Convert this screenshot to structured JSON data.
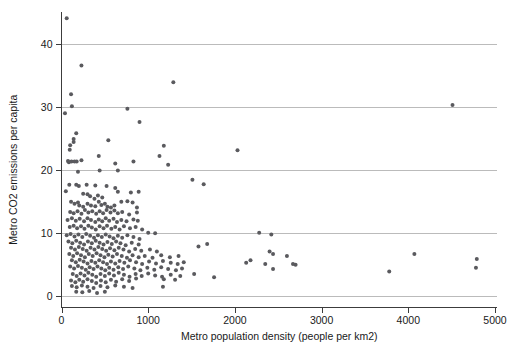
{
  "chart_data": {
    "type": "scatter",
    "title": "",
    "xlabel": "Metro population density (people per km2)",
    "ylabel": "Metro CO2 emissions per capita",
    "xlim": [
      -90,
      5050
    ],
    "ylim": [
      -1.2,
      45.5
    ],
    "xticks": [
      0,
      1000,
      2000,
      3000,
      4000,
      5000
    ],
    "yticks": [
      0,
      10,
      20,
      30,
      40
    ],
    "xticklabels": [
      "0",
      "1000",
      "2000",
      "3000",
      "4000",
      "5000"
    ],
    "yticklabels": [
      "0",
      "10",
      "20",
      "30",
      "40"
    ],
    "grid": "horizontal",
    "grid_color": "#bbbbbb",
    "marker_color": "#5a5a5e",
    "marker_size": 2.0,
    "legend": "none",
    "series": [
      {
        "name": "Metro areas",
        "points": [
          [
            60,
            44.1
          ],
          [
            230,
            36.6
          ],
          [
            1290,
            33.9
          ],
          [
            110,
            32.0
          ],
          [
            120,
            30.1
          ],
          [
            4510,
            30.3
          ],
          [
            40,
            29.0
          ],
          [
            760,
            29.7
          ],
          [
            900,
            27.6
          ],
          [
            2030,
            23.1
          ],
          [
            170,
            25.8
          ],
          [
            140,
            24.9
          ],
          [
            140,
            24.4
          ],
          [
            540,
            24.7
          ],
          [
            1180,
            23.8
          ],
          [
            100,
            23.9
          ],
          [
            95,
            23.2
          ],
          [
            1130,
            22.2
          ],
          [
            430,
            22.2
          ],
          [
            75,
            21.4
          ],
          [
            85,
            21.2
          ],
          [
            115,
            21.3
          ],
          [
            150,
            21.3
          ],
          [
            175,
            21.3
          ],
          [
            230,
            21.5
          ],
          [
            620,
            21.0
          ],
          [
            830,
            21.3
          ],
          [
            1230,
            20.8
          ],
          [
            190,
            19.7
          ],
          [
            440,
            19.9
          ],
          [
            650,
            19.9
          ],
          [
            90,
            17.6
          ],
          [
            170,
            17.6
          ],
          [
            200,
            17.4
          ],
          [
            290,
            17.6
          ],
          [
            390,
            17.5
          ],
          [
            520,
            17.4
          ],
          [
            620,
            17.1
          ],
          [
            1510,
            18.4
          ],
          [
            1640,
            17.7
          ],
          [
            50,
            16.6
          ],
          [
            250,
            16.2
          ],
          [
            300,
            16.1
          ],
          [
            330,
            15.8
          ],
          [
            380,
            15.4
          ],
          [
            420,
            15.9
          ],
          [
            470,
            15.6
          ],
          [
            650,
            16.5
          ],
          [
            800,
            16.4
          ],
          [
            890,
            16.5
          ],
          [
            110,
            14.9
          ],
          [
            150,
            14.6
          ],
          [
            190,
            14.8
          ],
          [
            205,
            14.3
          ],
          [
            250,
            14.1
          ],
          [
            300,
            14.6
          ],
          [
            340,
            14.3
          ],
          [
            390,
            14.2
          ],
          [
            430,
            14.9
          ],
          [
            460,
            14.4
          ],
          [
            500,
            14.6
          ],
          [
            530,
            14.1
          ],
          [
            570,
            14.0
          ],
          [
            610,
            14.3
          ],
          [
            690,
            14.9
          ],
          [
            760,
            15.0
          ],
          [
            820,
            14.8
          ],
          [
            870,
            14.0
          ],
          [
            100,
            13.3
          ],
          [
            140,
            13.1
          ],
          [
            185,
            13.4
          ],
          [
            230,
            13.0
          ],
          [
            270,
            13.6
          ],
          [
            310,
            13.2
          ],
          [
            355,
            13.4
          ],
          [
            400,
            13.0
          ],
          [
            440,
            13.4
          ],
          [
            480,
            13.1
          ],
          [
            520,
            13.6
          ],
          [
            565,
            13.2
          ],
          [
            610,
            13.5
          ],
          [
            650,
            13.1
          ],
          [
            700,
            13.3
          ],
          [
            780,
            12.9
          ],
          [
            870,
            13.2
          ],
          [
            70,
            12.0
          ],
          [
            120,
            12.3
          ],
          [
            165,
            11.9
          ],
          [
            210,
            12.2
          ],
          [
            260,
            11.8
          ],
          [
            300,
            12.3
          ],
          [
            340,
            12.0
          ],
          [
            390,
            11.7
          ],
          [
            430,
            12.1
          ],
          [
            470,
            11.8
          ],
          [
            510,
            12.3
          ],
          [
            550,
            11.9
          ],
          [
            600,
            12.2
          ],
          [
            640,
            11.7
          ],
          [
            690,
            12.0
          ],
          [
            750,
            11.8
          ],
          [
            830,
            12.1
          ],
          [
            880,
            11.9
          ],
          [
            95,
            10.9
          ],
          [
            140,
            11.1
          ],
          [
            180,
            10.7
          ],
          [
            225,
            11.0
          ],
          [
            265,
            10.6
          ],
          [
            310,
            11.1
          ],
          [
            350,
            10.8
          ],
          [
            395,
            10.5
          ],
          [
            440,
            11.0
          ],
          [
            485,
            10.7
          ],
          [
            525,
            11.1
          ],
          [
            575,
            10.6
          ],
          [
            620,
            10.9
          ],
          [
            670,
            10.5
          ],
          [
            720,
            11.0
          ],
          [
            790,
            10.7
          ],
          [
            855,
            10.9
          ],
          [
            930,
            10.5
          ],
          [
            1000,
            10.0
          ],
          [
            1080,
            9.9
          ],
          [
            2280,
            10.0
          ],
          [
            2420,
            9.7
          ],
          [
            60,
            9.6
          ],
          [
            105,
            9.8
          ],
          [
            150,
            9.4
          ],
          [
            195,
            9.7
          ],
          [
            240,
            9.3
          ],
          [
            285,
            9.8
          ],
          [
            330,
            9.5
          ],
          [
            375,
            9.2
          ],
          [
            420,
            9.6
          ],
          [
            465,
            9.3
          ],
          [
            510,
            9.7
          ],
          [
            555,
            9.4
          ],
          [
            600,
            9.1
          ],
          [
            650,
            9.5
          ],
          [
            700,
            9.2
          ],
          [
            760,
            9.6
          ],
          [
            830,
            9.3
          ],
          [
            900,
            9.0
          ],
          [
            80,
            8.6
          ],
          [
            125,
            8.3
          ],
          [
            170,
            8.7
          ],
          [
            215,
            8.4
          ],
          [
            260,
            8.1
          ],
          [
            305,
            8.6
          ],
          [
            350,
            8.3
          ],
          [
            395,
            8.7
          ],
          [
            440,
            8.4
          ],
          [
            485,
            8.1
          ],
          [
            530,
            8.5
          ],
          [
            580,
            8.2
          ],
          [
            630,
            8.6
          ],
          [
            680,
            8.3
          ],
          [
            740,
            8.0
          ],
          [
            810,
            8.4
          ],
          [
            890,
            8.1
          ],
          [
            1580,
            7.8
          ],
          [
            1680,
            8.2
          ],
          [
            2400,
            7.0
          ],
          [
            2440,
            6.6
          ],
          [
            110,
            7.6
          ],
          [
            155,
            7.3
          ],
          [
            200,
            7.7
          ],
          [
            245,
            7.4
          ],
          [
            290,
            7.1
          ],
          [
            335,
            7.6
          ],
          [
            380,
            7.3
          ],
          [
            425,
            7.7
          ],
          [
            470,
            7.4
          ],
          [
            515,
            7.1
          ],
          [
            560,
            7.5
          ],
          [
            610,
            7.2
          ],
          [
            660,
            7.6
          ],
          [
            715,
            7.3
          ],
          [
            780,
            7.0
          ],
          [
            850,
            7.4
          ],
          [
            920,
            7.1
          ],
          [
            1020,
            7.3
          ],
          [
            1100,
            7.0
          ],
          [
            4070,
            6.6
          ],
          [
            4790,
            5.8
          ],
          [
            90,
            6.6
          ],
          [
            135,
            6.3
          ],
          [
            180,
            6.7
          ],
          [
            225,
            6.4
          ],
          [
            270,
            6.1
          ],
          [
            315,
            6.6
          ],
          [
            360,
            6.3
          ],
          [
            405,
            6.7
          ],
          [
            450,
            6.4
          ],
          [
            495,
            6.1
          ],
          [
            540,
            6.5
          ],
          [
            590,
            6.2
          ],
          [
            640,
            6.6
          ],
          [
            695,
            6.3
          ],
          [
            755,
            6.0
          ],
          [
            820,
            6.4
          ],
          [
            890,
            6.1
          ],
          [
            960,
            6.3
          ],
          [
            1050,
            6.0
          ],
          [
            1150,
            6.4
          ],
          [
            1250,
            6.1
          ],
          [
            1350,
            6.3
          ],
          [
            2180,
            5.6
          ],
          [
            2350,
            5.0
          ],
          [
            2600,
            6.3
          ],
          [
            2130,
            5.2
          ],
          [
            120,
            5.6
          ],
          [
            165,
            5.3
          ],
          [
            210,
            5.7
          ],
          [
            255,
            5.4
          ],
          [
            300,
            5.1
          ],
          [
            345,
            5.5
          ],
          [
            390,
            5.2
          ],
          [
            435,
            5.6
          ],
          [
            480,
            5.3
          ],
          [
            525,
            5.0
          ],
          [
            570,
            5.4
          ],
          [
            620,
            5.1
          ],
          [
            670,
            5.5
          ],
          [
            725,
            5.2
          ],
          [
            790,
            5.6
          ],
          [
            860,
            5.3
          ],
          [
            930,
            5.0
          ],
          [
            1010,
            5.4
          ],
          [
            1090,
            5.1
          ],
          [
            1170,
            5.5
          ],
          [
            1260,
            5.2
          ],
          [
            1340,
            5.0
          ],
          [
            1410,
            5.3
          ],
          [
            2670,
            5.0
          ],
          [
            2700,
            4.9
          ],
          [
            4780,
            4.4
          ],
          [
            100,
            4.6
          ],
          [
            145,
            4.3
          ],
          [
            190,
            4.7
          ],
          [
            235,
            4.4
          ],
          [
            280,
            4.1
          ],
          [
            325,
            4.5
          ],
          [
            370,
            4.2
          ],
          [
            415,
            4.6
          ],
          [
            460,
            4.3
          ],
          [
            505,
            4.0
          ],
          [
            550,
            4.4
          ],
          [
            600,
            4.1
          ],
          [
            655,
            4.5
          ],
          [
            710,
            4.2
          ],
          [
            770,
            4.6
          ],
          [
            840,
            4.3
          ],
          [
            910,
            4.0
          ],
          [
            990,
            4.4
          ],
          [
            1070,
            4.1
          ],
          [
            1150,
            4.5
          ],
          [
            1230,
            4.2
          ],
          [
            1320,
            4.0
          ],
          [
            1390,
            4.3
          ],
          [
            2440,
            4.2
          ],
          [
            3780,
            3.8
          ],
          [
            130,
            3.4
          ],
          [
            175,
            3.1
          ],
          [
            220,
            3.5
          ],
          [
            265,
            3.2
          ],
          [
            310,
            3.6
          ],
          [
            355,
            3.3
          ],
          [
            400,
            3.0
          ],
          [
            450,
            3.4
          ],
          [
            500,
            3.1
          ],
          [
            550,
            3.5
          ],
          [
            605,
            3.2
          ],
          [
            660,
            3.6
          ],
          [
            720,
            3.3
          ],
          [
            785,
            3.0
          ],
          [
            855,
            3.4
          ],
          [
            925,
            3.1
          ],
          [
            1000,
            3.5
          ],
          [
            1080,
            3.2
          ],
          [
            1160,
            3.0
          ],
          [
            1260,
            3.3
          ],
          [
            1370,
            3.1
          ],
          [
            1760,
            2.9
          ],
          [
            1530,
            3.4
          ],
          [
            110,
            2.4
          ],
          [
            160,
            2.1
          ],
          [
            205,
            2.5
          ],
          [
            250,
            2.2
          ],
          [
            300,
            2.6
          ],
          [
            350,
            2.3
          ],
          [
            400,
            2.0
          ],
          [
            455,
            2.4
          ],
          [
            510,
            2.1
          ],
          [
            570,
            2.5
          ],
          [
            630,
            2.2
          ],
          [
            700,
            2.6
          ],
          [
            780,
            2.3
          ],
          [
            860,
            2.7
          ],
          [
            1180,
            2.6
          ],
          [
            1310,
            2.5
          ],
          [
            120,
            1.5
          ],
          [
            175,
            1.3
          ],
          [
            235,
            1.6
          ],
          [
            300,
            1.4
          ],
          [
            370,
            1.2
          ],
          [
            450,
            1.5
          ],
          [
            530,
            1.3
          ],
          [
            620,
            1.6
          ],
          [
            720,
            1.4
          ],
          [
            820,
            1.2
          ],
          [
            1170,
            1.4
          ],
          [
            170,
            0.6
          ],
          [
            240,
            0.5
          ],
          [
            320,
            0.7
          ],
          [
            410,
            0.4
          ],
          [
            500,
            0.6
          ]
        ]
      }
    ]
  }
}
